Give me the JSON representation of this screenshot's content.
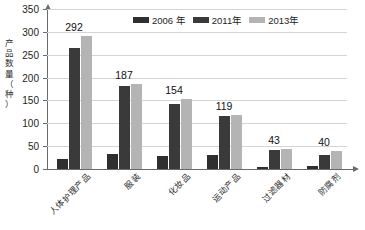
{
  "chart_data": {
    "type": "bar",
    "title": "",
    "xlabel": "",
    "ylabel": "产品数量（种）",
    "ylim": [
      0,
      350
    ],
    "yticks": [
      0,
      50,
      100,
      150,
      200,
      250,
      300,
      350
    ],
    "grid": true,
    "legend_position": "top-center",
    "categories": [
      "人体护理产品",
      "服装",
      "化妆品",
      "运动产品",
      "过滤器材",
      "防腐剂"
    ],
    "series": [
      {
        "name": "2006 年",
        "color": "#2f2f2f",
        "values": [
          22,
          33,
          28,
          30,
          4,
          6
        ]
      },
      {
        "name": "2011年",
        "color": "#3a3a3a",
        "values": [
          265,
          181,
          142,
          117,
          42,
          30
        ]
      },
      {
        "name": "2013年",
        "color": "#b4b4b4",
        "values": [
          292,
          187,
          154,
          119,
          43,
          40
        ]
      }
    ],
    "data_labels": [
      292,
      187,
      154,
      119,
      43,
      40
    ]
  },
  "axis": {
    "y_title_chars": [
      "产",
      "品",
      "数",
      "量",
      "（",
      "种",
      "）"
    ]
  }
}
